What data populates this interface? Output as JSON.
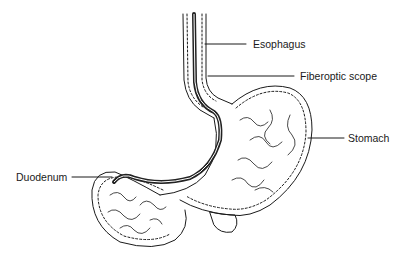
{
  "diagram": {
    "type": "anatomical-illustration",
    "labels": [
      {
        "id": "esophagus",
        "text": "Esophagus"
      },
      {
        "id": "fiberoptic-scope",
        "text": "Fiberoptic scope"
      },
      {
        "id": "stomach",
        "text": "Stomach"
      },
      {
        "id": "duodenum",
        "text": "Duodenum"
      }
    ],
    "colors": {
      "line": "#1a1a1a",
      "scope": "#222222",
      "background": "#ffffff"
    }
  }
}
